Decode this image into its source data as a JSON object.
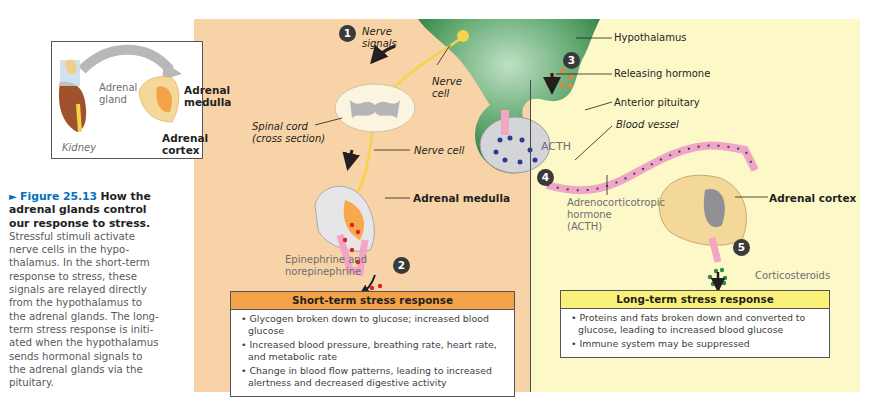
{
  "figure": {
    "number": "Figure 25.13",
    "title": "How the adrenal glands control our response to stress.",
    "caption_lines": [
      "Stressful stimuli activate",
      "nerve cells in the hypo-",
      "thalamus. In the short-term",
      "response to stress, these",
      "signals are relayed directly",
      "from the hypothalamus to",
      "the adrenal glands. The long-",
      "term stress response is initi-",
      "ated when the hypothalamus",
      "sends hormonal signals to",
      "the adrenal glands via the",
      "pituitary."
    ],
    "title_lines": [
      "How the",
      "adrenal glands control",
      "our response to stress."
    ]
  },
  "inset": {
    "adrenal_gland": "Adrenal",
    "adrenal_gland_2": "gland",
    "kidney": "Kidney",
    "adrenal_medulla_1": "Adrenal",
    "adrenal_medulla_2": "medulla",
    "adrenal_cortex_1": "Adrenal",
    "adrenal_cortex_2": "cortex"
  },
  "diagram": {
    "steps": [
      "1",
      "2",
      "3",
      "4",
      "5"
    ],
    "nerve_signals_1": "Nerve",
    "nerve_signals_2": "signals",
    "nerve_cell_top_1": "Nerve",
    "nerve_cell_top_2": "cell",
    "spinal_cord_1": "Spinal cord",
    "spinal_cord_2": "(cross section)",
    "nerve_cell": "Nerve cell",
    "adrenal_medulla": "Adrenal medulla",
    "epinephrine_1": "Epinephrine and",
    "epinephrine_2": "norepinephrine",
    "hypothalamus": "Hypothalamus",
    "releasing_hormone": "Releasing hormone",
    "anterior_pituitary": "Anterior pituitary",
    "blood_vessel": "Blood vessel",
    "acth": "ACTH",
    "acth_label_1": "Adrenocorticotropic",
    "acth_label_2": "hormone",
    "acth_label_3": "(ACTH)",
    "adrenal_cortex": "Adrenal cortex",
    "corticosteroids": "Corticosteroids"
  },
  "short_term": {
    "title": "Short-term stress response",
    "items": [
      "Glycogen broken down to glucose; increased blood glucose",
      "Increased blood pressure, breathing rate, heart rate, and metabolic rate",
      "Change in blood flow patterns, leading to increased alertness and decreased digestive activity"
    ]
  },
  "long_term": {
    "title": "Long-term stress response",
    "items": [
      "Proteins and fats broken down and converted to glucose, leading to increased blood glucose",
      "Immune system may be suppressed"
    ]
  },
  "colors": {
    "short_term_panel": "#f8d3a7",
    "long_term_panel": "#fdf8c8",
    "short_header": "#f4a24a",
    "long_header": "#faf17a",
    "figure_blue": "#0072bc",
    "hypothalamus_green": "#2e8b4e"
  }
}
